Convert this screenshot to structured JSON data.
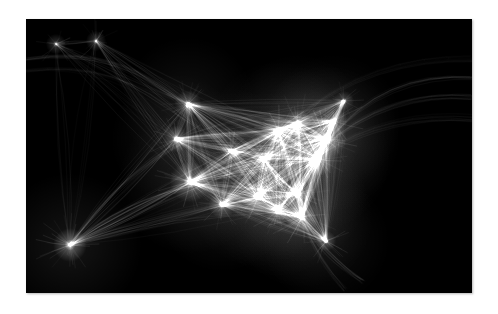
{
  "page": {
    "background_color": "#ffffff",
    "width": 498,
    "height": 314
  },
  "visualization": {
    "title": "",
    "type": "network-density-map",
    "subject": "Global flight routes over North America",
    "panel": {
      "x": 26,
      "y": 19,
      "width": 446,
      "height": 274,
      "background_color": "#000000",
      "line_color": "#ffffff",
      "border_shadow_color": "#787878"
    }
  },
  "chart_data": {
    "type": "scatter",
    "title": "",
    "subtitle": "",
    "xlabel": "",
    "ylabel": "",
    "grid": false,
    "legend": null,
    "xlim": [
      0,
      446
    ],
    "ylim": [
      0,
      274
    ],
    "background": "#000000",
    "stroke": "#ffffff",
    "nodes": [
      {
        "name": "pacific-arc-node-a",
        "x": 30,
        "y": 25,
        "brightness": 0.55,
        "radius": 3
      },
      {
        "name": "pacific-arc-node-b",
        "x": 70,
        "y": 22,
        "brightness": 0.6,
        "radius": 3
      },
      {
        "name": "hawaii-hub",
        "x": 44,
        "y": 226,
        "brightness": 0.95,
        "radius": 5
      },
      {
        "name": "pacific-northwest",
        "x": 162,
        "y": 85,
        "brightness": 0.8,
        "radius": 4
      },
      {
        "name": "west-coast-north",
        "x": 150,
        "y": 120,
        "brightness": 0.75,
        "radius": 4
      },
      {
        "name": "west-coast-hub",
        "x": 164,
        "y": 163,
        "brightness": 0.95,
        "radius": 6
      },
      {
        "name": "southwest-hub",
        "x": 196,
        "y": 186,
        "brightness": 0.8,
        "radius": 4
      },
      {
        "name": "mountain-west",
        "x": 205,
        "y": 132,
        "brightness": 0.7,
        "radius": 3
      },
      {
        "name": "central-plains",
        "x": 238,
        "y": 140,
        "brightness": 0.8,
        "radius": 4
      },
      {
        "name": "midwest-hub",
        "x": 252,
        "y": 112,
        "brightness": 0.88,
        "radius": 5
      },
      {
        "name": "great-lakes-hub",
        "x": 272,
        "y": 104,
        "brightness": 0.85,
        "radius": 4
      },
      {
        "name": "texas-hub",
        "x": 232,
        "y": 178,
        "brightness": 0.9,
        "radius": 5
      },
      {
        "name": "gulf-coast",
        "x": 252,
        "y": 192,
        "brightness": 0.78,
        "radius": 4
      },
      {
        "name": "southeast-hub",
        "x": 272,
        "y": 175,
        "brightness": 0.85,
        "radius": 4
      },
      {
        "name": "northeast-hub",
        "x": 300,
        "y": 120,
        "brightness": 1.0,
        "radius": 6
      },
      {
        "name": "mid-atlantic-hub",
        "x": 292,
        "y": 140,
        "brightness": 0.95,
        "radius": 5
      },
      {
        "name": "atlantic-coast",
        "x": 308,
        "y": 102,
        "brightness": 0.8,
        "radius": 4
      },
      {
        "name": "florida-hub",
        "x": 276,
        "y": 198,
        "brightness": 0.92,
        "radius": 5
      },
      {
        "name": "caribbean-node",
        "x": 300,
        "y": 222,
        "brightness": 0.7,
        "radius": 3
      },
      {
        "name": "canada-east",
        "x": 318,
        "y": 82,
        "brightness": 0.55,
        "radius": 3
      }
    ],
    "long_haul_arcs": [
      {
        "name": "trans-pacific-north",
        "from": [
          0,
          40
        ],
        "to": [
          168,
          96
        ],
        "bow": -46,
        "brightness": 0.3
      },
      {
        "name": "trans-pacific-south",
        "from": [
          0,
          52
        ],
        "to": [
          160,
          104
        ],
        "bow": -40,
        "brightness": 0.22
      },
      {
        "name": "hawaii-to-mainland",
        "from": [
          44,
          226
        ],
        "to": [
          166,
          166
        ],
        "bow": -14,
        "brightness": 0.45
      },
      {
        "name": "hawaii-to-northwest",
        "from": [
          44,
          226
        ],
        "to": [
          160,
          120
        ],
        "bow": -18,
        "brightness": 0.32
      },
      {
        "name": "trans-atlantic-1",
        "from": [
          302,
          122
        ],
        "to": [
          446,
          58
        ],
        "bow": -42,
        "brightness": 0.4
      },
      {
        "name": "trans-atlantic-2",
        "from": [
          298,
          128
        ],
        "to": [
          446,
          78
        ],
        "bow": -34,
        "brightness": 0.34
      },
      {
        "name": "trans-atlantic-3",
        "from": [
          294,
          136
        ],
        "to": [
          446,
          100
        ],
        "bow": -26,
        "brightness": 0.26
      },
      {
        "name": "polar-route",
        "from": [
          268,
          100
        ],
        "to": [
          446,
          40
        ],
        "bow": -36,
        "brightness": 0.2
      },
      {
        "name": "caribbean-fan",
        "from": [
          276,
          198
        ],
        "to": [
          336,
          262
        ],
        "bow": 10,
        "brightness": 0.35
      },
      {
        "name": "south-america",
        "from": [
          278,
          204
        ],
        "to": [
          318,
          272
        ],
        "bow": 8,
        "brightness": 0.28
      }
    ]
  }
}
